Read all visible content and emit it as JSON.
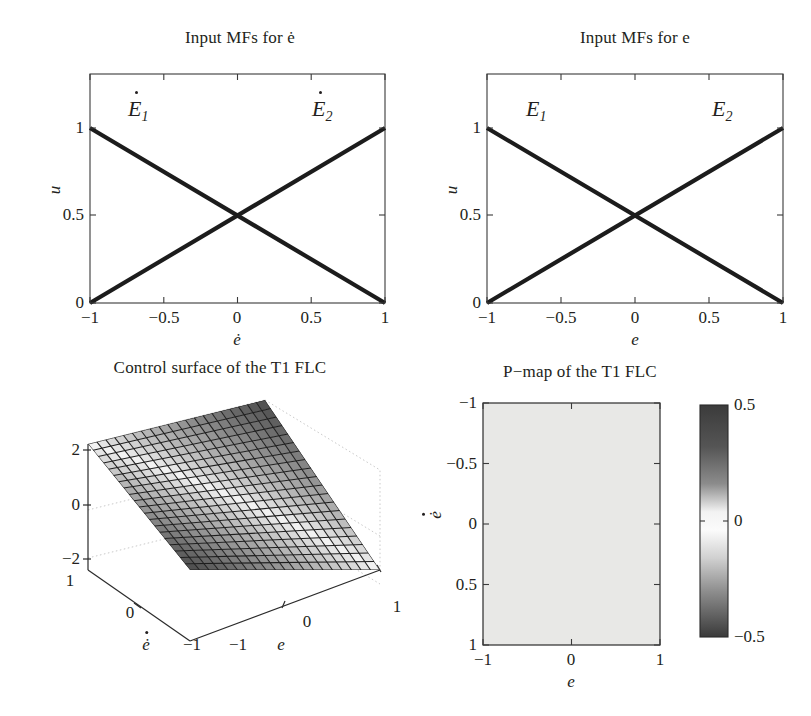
{
  "figure": {
    "width": 811,
    "height": 716,
    "background": "#ffffff",
    "ink": "#231f20"
  },
  "chart_data": [
    {
      "id": "input-mfs-edot",
      "type": "line",
      "title": "Input MFs for ė",
      "xlabel": "ė",
      "ylabel": "u",
      "xlim": [
        -1,
        1
      ],
      "ylim": [
        0,
        1.18
      ],
      "grid": false,
      "legend_position": "in-plot-annotations",
      "xticks": [
        -1,
        -0.5,
        0,
        0.5,
        1
      ],
      "xticklabels": [
        "−1",
        "−0.5",
        "0",
        "0.5",
        "1"
      ],
      "yticks": [
        0,
        0.5,
        1
      ],
      "yticklabels": [
        "0",
        "0.5",
        "1"
      ],
      "series": [
        {
          "name": "Ė₁",
          "x": [
            -1,
            1
          ],
          "values": [
            1,
            0
          ]
        },
        {
          "name": "Ė₂",
          "x": [
            -1,
            1
          ],
          "values": [
            0,
            1
          ]
        }
      ],
      "annotations": [
        {
          "text": "E",
          "sub": "1",
          "dot": true,
          "x": -0.62,
          "y": 1.0
        },
        {
          "text": "E",
          "sub": "2",
          "dot": true,
          "x": 0.56,
          "y": 1.0
        }
      ]
    },
    {
      "id": "input-mfs-e",
      "type": "line",
      "title": "Input MFs for e",
      "xlabel": "e",
      "ylabel": "u",
      "xlim": [
        -1,
        1
      ],
      "ylim": [
        0,
        1.18
      ],
      "grid": false,
      "legend_position": "in-plot-annotations",
      "xticks": [
        -1,
        -0.5,
        0,
        0.5,
        1
      ],
      "xticklabels": [
        "−1",
        "−0.5",
        "0",
        "0.5",
        "1"
      ],
      "yticks": [
        0,
        0.5,
        1
      ],
      "yticklabels": [
        "0",
        "0.5",
        "1"
      ],
      "series": [
        {
          "name": "E₁",
          "x": [
            -1,
            1
          ],
          "values": [
            1,
            0
          ]
        },
        {
          "name": "E₂",
          "x": [
            -1,
            1
          ],
          "values": [
            0,
            1
          ]
        }
      ],
      "annotations": [
        {
          "text": "E",
          "sub": "1",
          "dot": false,
          "x": -0.6,
          "y": 1.0
        },
        {
          "text": "E",
          "sub": "2",
          "dot": false,
          "x": 0.58,
          "y": 1.0
        }
      ]
    },
    {
      "id": "control-surface-t1-flc",
      "type": "surface",
      "title": "Control surface of the T1 FLC",
      "xlabel": "e",
      "ylabel": "ė",
      "zlabel": "",
      "xlim": [
        -1,
        1
      ],
      "ylim": [
        -1,
        1
      ],
      "zlim": [
        -3,
        3
      ],
      "grid": true,
      "xticks": [
        -1,
        0,
        1
      ],
      "xticklabels": [
        "−1",
        "0",
        "1"
      ],
      "yticks": [
        -1,
        0,
        1
      ],
      "yticklabels": [
        "−1",
        "0",
        "1"
      ],
      "zticks": [
        -2,
        0,
        2
      ],
      "zticklabels": [
        "−2",
        "0",
        "2"
      ],
      "mesh": {
        "rows": 21,
        "cols": 21
      },
      "description": "Planar control surface u = e + edot, rendered as a shaded wireframe mesh tilted in 3-D; lightest along the central diagonal band, darkening toward the upper and lower edges.",
      "z_corners": {
        "e-1_edot-1": -2,
        "e1_edot-1": 0,
        "e-1_edot1": 0,
        "e1_edot1": 2
      }
    },
    {
      "id": "p-map-t1-flc",
      "type": "heatmap",
      "title": "P−map of the T1 FLC",
      "xlabel": "e",
      "ylabel": "ė",
      "xlim": [
        -1,
        1
      ],
      "ylim": [
        -1,
        1
      ],
      "y_axis_inverted": true,
      "grid": false,
      "xticks": [
        -1,
        0,
        1
      ],
      "xticklabels": [
        "−1",
        "0",
        "1"
      ],
      "yticks": [
        -1,
        -0.5,
        0,
        0.5,
        1
      ],
      "yticklabels": [
        "−1",
        "−0.5",
        "0",
        "0.5",
        "1"
      ],
      "value_uniform": 0,
      "fill_color": "#e8e8e6",
      "description": "Uniform light-gray field: the P-map value is essentially 0 everywhere over the e / ė domain.",
      "colorbar": {
        "vmin": -0.5,
        "vmax": 0.5,
        "ticks": [
          0.5,
          0,
          -0.5
        ],
        "ticklabels": [
          "0.5",
          "0",
          "−0.5"
        ],
        "colormap": "gray-center-bright",
        "stops": [
          {
            "pos": 0.0,
            "color": "#3b3b3b"
          },
          {
            "pos": 0.18,
            "color": "#555555"
          },
          {
            "pos": 0.34,
            "color": "#8c8c8c"
          },
          {
            "pos": 0.46,
            "color": "#f2f2f2"
          },
          {
            "pos": 0.54,
            "color": "#fbfbfb"
          },
          {
            "pos": 0.66,
            "color": "#d0d0d0"
          },
          {
            "pos": 0.8,
            "color": "#8f8f8f"
          },
          {
            "pos": 1.0,
            "color": "#3a3a3a"
          }
        ]
      }
    }
  ]
}
